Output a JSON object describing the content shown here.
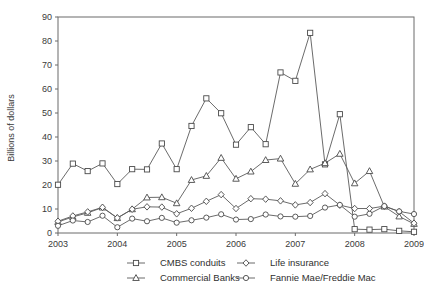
{
  "chart_data": {
    "type": "line",
    "title": "",
    "subtitle": "",
    "xlabel": "",
    "ylabel": "Billions of dollars",
    "xlim": [
      2003.0,
      2009.0
    ],
    "ylim": [
      0,
      90
    ],
    "ytick_step": 10,
    "yticks": [
      0,
      10,
      20,
      30,
      40,
      50,
      60,
      70,
      80,
      90
    ],
    "xticks": [
      2003,
      2004,
      2005,
      2006,
      2007,
      2008,
      2009
    ],
    "xtick_labels": [
      "2003",
      "2004",
      "2005",
      "2006",
      "2007",
      "2008",
      "2009"
    ],
    "grid": false,
    "legend_position": "bottom",
    "x": [
      2003.0,
      2003.25,
      2003.5,
      2003.75,
      2004.0,
      2004.25,
      2004.5,
      2004.75,
      2005.0,
      2005.25,
      2005.5,
      2005.75,
      2006.0,
      2006.25,
      2006.5,
      2006.75,
      2007.0,
      2007.25,
      2007.5,
      2007.75,
      2008.0,
      2008.25,
      2008.5,
      2008.75,
      2009.0
    ],
    "series": [
      {
        "name": "CMBS conduits",
        "marker": "square",
        "values": [
          20.1,
          28.9,
          25.8,
          29.0,
          20.4,
          26.6,
          26.5,
          37.3,
          26.6,
          44.6,
          56.1,
          49.9,
          36.8,
          44.1,
          37.0,
          66.9,
          63.4,
          83.4,
          28.6,
          49.5,
          1.6,
          1.4,
          1.6,
          0.9,
          0.5
        ]
      },
      {
        "name": "Commercial Banks",
        "marker": "triangle",
        "values": [
          4.6,
          6.7,
          8.4,
          10.6,
          6.2,
          9.9,
          14.8,
          14.9,
          12.4,
          22.1,
          23.8,
          31.3,
          22.6,
          25.6,
          30.4,
          31.0,
          20.5,
          26.5,
          29.1,
          33.0,
          20.7,
          25.8,
          11.0,
          6.9,
          3.8
        ]
      },
      {
        "name": "Life insurance",
        "marker": "diamond",
        "values": [
          4.9,
          7.1,
          8.8,
          10.7,
          6.3,
          9.9,
          10.9,
          10.8,
          8.0,
          10.3,
          13.2,
          16.0,
          10.2,
          14.3,
          14.1,
          13.4,
          11.7,
          12.7,
          16.4,
          11.6,
          10.2,
          10.2,
          11.2,
          8.9,
          4.1
        ]
      },
      {
        "name": "Fannie Mae/Freddie Mac",
        "marker": "circle",
        "values": [
          3.0,
          5.2,
          4.6,
          7.2,
          2.4,
          6.0,
          4.9,
          6.3,
          4.3,
          5.3,
          6.4,
          7.8,
          5.6,
          5.8,
          7.7,
          6.9,
          6.8,
          7.1,
          10.6,
          11.7,
          6.8,
          8.0,
          11.2,
          9.0,
          7.9
        ]
      }
    ]
  },
  "legend": {
    "entries": [
      {
        "label": "CMBS conduits",
        "marker": "square"
      },
      {
        "label": "Life insurance",
        "marker": "diamond"
      },
      {
        "label": "Commercial Banks",
        "marker": "triangle"
      },
      {
        "label": "Fannie Mae/Freddie Mac",
        "marker": "circle"
      }
    ]
  }
}
